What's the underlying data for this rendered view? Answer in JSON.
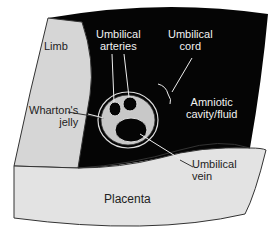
{
  "diagram": {
    "type": "ultrasound cross-section illustration",
    "labels": {
      "limb": "Limb",
      "arteries_line1": "Umbilical",
      "arteries_line2": "arteries",
      "cord_line1": "Umbilical",
      "cord_line2": "cord",
      "amniotic_line1": "Amniotic",
      "amniotic_line2": "cavity/fluid",
      "wharton_line1": "Wharton's",
      "wharton_line2": "jelly",
      "vein_line1": "Umbilical",
      "vein_line2": "vein",
      "placenta": "Placenta"
    },
    "colors": {
      "fluid": "#050505",
      "limb": "#d6d6d6",
      "placenta": "#e3e3e3",
      "jelly": "#c8c8c8",
      "outline": "#333333"
    }
  }
}
